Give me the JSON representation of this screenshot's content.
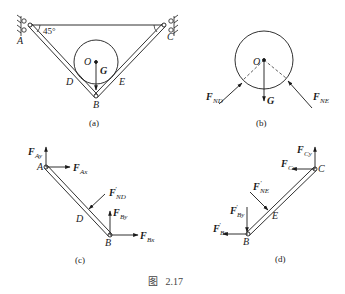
{
  "figure": {
    "caption": "图   2.17",
    "ink_color": "#1a1a1a",
    "panels": {
      "a": {
        "label": "(a)",
        "points": {
          "A": "A",
          "B": "B",
          "C": "C",
          "D": "D",
          "E": "E",
          "O": "O"
        },
        "angle_label": "45°",
        "weight_label": "G"
      },
      "b": {
        "label": "(b)",
        "center_label": "O",
        "forces": {
          "FND": {
            "main": "F",
            "sub": "ND"
          },
          "FNE": {
            "main": "F",
            "sub": "NE"
          },
          "G": "G"
        }
      },
      "c": {
        "label": "(c)",
        "points": {
          "A": "A",
          "B": "B",
          "D": "D"
        },
        "forces": {
          "FAy": {
            "main": "F",
            "sub": "Ay"
          },
          "FAx": {
            "main": "F",
            "sub": "Ax"
          },
          "FND": {
            "main": "F",
            "prime": "′",
            "sub": "ND"
          },
          "FBy": {
            "main": "F",
            "sub": "By"
          },
          "FBx": {
            "main": "F",
            "sub": "Bx"
          }
        }
      },
      "d": {
        "label": "(d)",
        "points": {
          "B": "B",
          "C": "C",
          "E": "E"
        },
        "forces": {
          "FCy": {
            "main": "F",
            "sub": "Cy"
          },
          "FCx": {
            "main": "F",
            "sub": "Cx"
          },
          "FNE": {
            "main": "F",
            "prime": "′",
            "sub": "NE"
          },
          "FBy": {
            "main": "F",
            "prime": "′",
            "sub": "By"
          },
          "FBx": {
            "main": "F",
            "prime": "′",
            "sub": "Bx"
          }
        }
      }
    }
  }
}
